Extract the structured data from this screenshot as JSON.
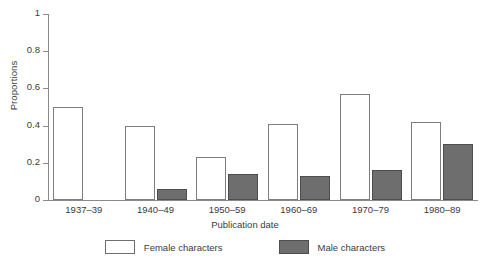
{
  "chart_data": {
    "type": "bar",
    "title": "",
    "xlabel": "Publication date",
    "ylabel": "Proportions",
    "categories": [
      "1937–39",
      "1940–49",
      "1950–59",
      "1960–69",
      "1970–79",
      "1980–89"
    ],
    "series": [
      {
        "name": "Female characters",
        "color": "#ffffff",
        "edge_color": "#7d7d7d",
        "values": [
          0.5,
          0.4,
          0.23,
          0.41,
          0.57,
          0.42
        ]
      },
      {
        "name": "Male characters",
        "color": "#6e6e6e",
        "edge_color": "#4d4d4d",
        "values": [
          0.0,
          0.06,
          0.14,
          0.13,
          0.16,
          0.3
        ]
      }
    ],
    "ylim": [
      0,
      1
    ],
    "yticks": [
      0,
      0.2,
      0.4,
      0.6,
      0.8,
      1
    ],
    "ytick_labels": [
      "0",
      "0.2",
      "0.4",
      "0.6",
      "0.8",
      "1"
    ],
    "grid": false,
    "legend_position": "bottom-center"
  }
}
